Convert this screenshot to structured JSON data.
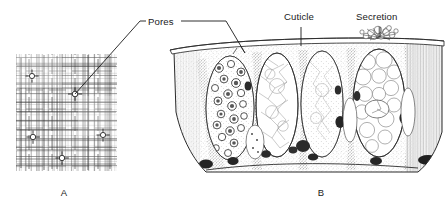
{
  "figure": {
    "style": "pen-and-ink scientific line drawing",
    "background_color": "#ffffff",
    "ink_color": "#1a1a1a"
  },
  "labels": [
    {
      "id": "pores",
      "text": "Pores",
      "x": 152,
      "y": 21,
      "leader": "double",
      "points_to": [
        "panel-a-pore-center",
        "panel-b-cuticle-pore"
      ]
    },
    {
      "id": "cuticle",
      "text": "Cuticle",
      "x": 300,
      "y": 21,
      "leader": "vertical",
      "points_to": [
        "panel-b-cuticle-layer"
      ]
    },
    {
      "id": "secretion",
      "text": "Secretion",
      "x": 379,
      "y": 21,
      "leader": "vertical",
      "points_to": [
        "panel-b-secretion-burst"
      ]
    }
  ],
  "panels": [
    {
      "id": "panel-a",
      "letter": "A",
      "letter_x": 64,
      "letter_y": 193,
      "view": "surface view of cuticle",
      "bounds": {
        "x": 16,
        "y": 54,
        "width": 101,
        "height": 117
      },
      "texture": "fine cross-hatched grid",
      "pore_count": 5,
      "pores": [
        {
          "cx": 32,
          "cy": 76,
          "r": 2.6
        },
        {
          "cx": 75,
          "cy": 94,
          "r": 2.8
        },
        {
          "cx": 33,
          "cy": 137,
          "r": 2.7
        },
        {
          "cx": 103,
          "cy": 135,
          "r": 2.6
        },
        {
          "cx": 62,
          "cy": 158,
          "r": 2.7
        }
      ]
    },
    {
      "id": "panel-b",
      "letter": "B",
      "letter_x": 321,
      "letter_y": 193,
      "view": "vertical section through integument",
      "bounds": {
        "x": 168,
        "y": 42,
        "width": 278,
        "height": 133
      },
      "features": [
        "cuticle",
        "epidermal gland cells",
        "granular secretory cell",
        "vesicular gland cell",
        "pore canal",
        "secretion droplet",
        "basement membrane"
      ],
      "cell_count": 5
    }
  ]
}
